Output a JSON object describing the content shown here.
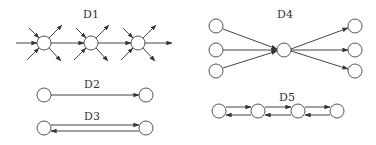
{
  "colors": {
    "background": "#ffffff",
    "stroke": "#444444",
    "node_fill": "#ffffff",
    "text": "#333333"
  },
  "diagrams": [
    {
      "label": "D1",
      "label_pos": [
        91,
        18
      ],
      "nodes": [
        [
          44,
          43
        ],
        [
          91,
          43
        ],
        [
          138,
          43
        ]
      ],
      "edges": [
        [
          16,
          43,
          37,
          43
        ],
        [
          51,
          43,
          84,
          43
        ],
        [
          98,
          43,
          131,
          43
        ],
        [
          145,
          43,
          172,
          43
        ],
        [
          29,
          28,
          39,
          38
        ],
        [
          49,
          38,
          62,
          25
        ],
        [
          27,
          60,
          39,
          48
        ],
        [
          49,
          48,
          61,
          61
        ],
        [
          76,
          28,
          86,
          38
        ],
        [
          96,
          38,
          109,
          25
        ],
        [
          74,
          60,
          86,
          48
        ],
        [
          96,
          48,
          108,
          61
        ],
        [
          123,
          28,
          133,
          38
        ],
        [
          143,
          38,
          156,
          25
        ],
        [
          121,
          60,
          133,
          48
        ],
        [
          143,
          48,
          155,
          61
        ]
      ]
    },
    {
      "label": "D2",
      "label_pos": [
        92,
        88
      ],
      "nodes": [
        [
          44,
          95
        ],
        [
          146,
          95
        ]
      ],
      "edges": [
        [
          51,
          95,
          139,
          95
        ]
      ]
    },
    {
      "label": "D3",
      "label_pos": [
        92,
        120
      ],
      "nodes": [
        [
          44,
          128
        ],
        [
          146,
          128
        ]
      ],
      "edges": [
        [
          51,
          125,
          139,
          125
        ],
        [
          139,
          131,
          51,
          131
        ]
      ]
    },
    {
      "label": "D4",
      "label_pos": [
        285,
        18
      ],
      "nodes": [
        [
          216,
          26
        ],
        [
          216,
          50
        ],
        [
          216,
          71
        ],
        [
          284,
          50
        ],
        [
          355,
          26
        ],
        [
          355,
          50
        ],
        [
          355,
          71
        ]
      ],
      "edges": [
        [
          223,
          29,
          277,
          49
        ],
        [
          223,
          50,
          277,
          50
        ],
        [
          223,
          68,
          277,
          51
        ],
        [
          291,
          49,
          348,
          28
        ],
        [
          291,
          50,
          348,
          50
        ],
        [
          291,
          51,
          348,
          69
        ]
      ]
    },
    {
      "label": "D5",
      "label_pos": [
        287,
        101
      ],
      "nodes": [
        [
          219,
          111
        ],
        [
          258,
          111
        ],
        [
          298,
          111
        ],
        [
          337,
          111
        ]
      ],
      "edges": [
        [
          226,
          107,
          251,
          107
        ],
        [
          251,
          115,
          226,
          115
        ],
        [
          265,
          107,
          291,
          107
        ],
        [
          291,
          115,
          265,
          115
        ],
        [
          305,
          107,
          330,
          107
        ],
        [
          330,
          115,
          305,
          115
        ]
      ]
    }
  ],
  "node_radius": 7
}
